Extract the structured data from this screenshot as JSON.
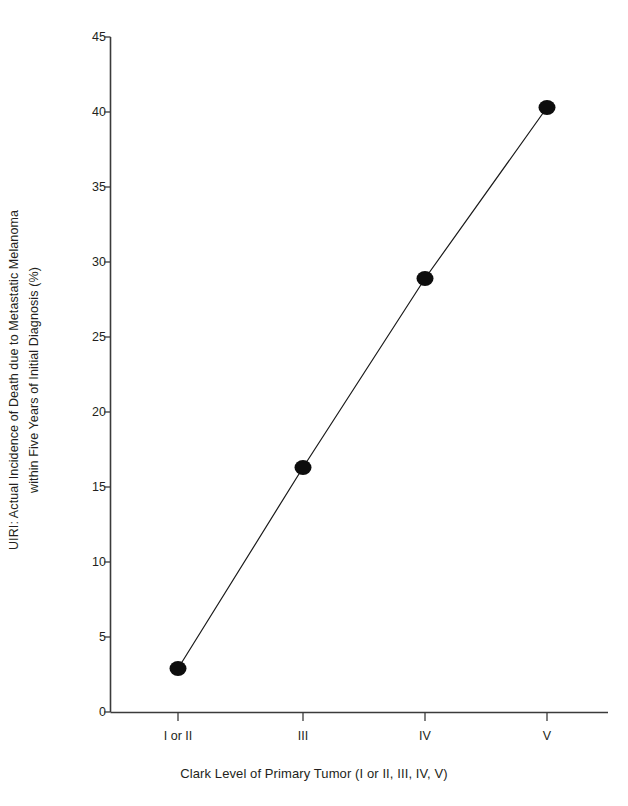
{
  "chart_data": {
    "type": "line",
    "title": "",
    "categories": [
      "I or II",
      "III",
      "IV",
      "V"
    ],
    "values": [
      2.9,
      16.3,
      28.9,
      40.3
    ],
    "series": [
      {
        "name": "UIRI",
        "values": [
          2.9,
          16.3,
          28.9,
          40.3
        ]
      }
    ],
    "xlabel": "Clark Level of Primary Tumor (I or II, III, IV, V)",
    "ylabel_line1": "UIRI: Actual Incidence of Death due to Metastatic Melanoma",
    "ylabel_line2": "within Five Years of Initial Diagnosis (%)",
    "ylim": [
      0,
      45
    ],
    "yticks": [
      0,
      5,
      10,
      15,
      20,
      25,
      30,
      35,
      40,
      45
    ],
    "ytick_labels": [
      "0",
      "5",
      "10",
      "15",
      "20",
      "25",
      "30",
      "35",
      "40",
      "45"
    ],
    "xtick_labels": [
      "I or II",
      "III",
      "IV",
      "V"
    ],
    "grid": false,
    "legend": false,
    "legend_position": "none",
    "marker": "filled-circle",
    "colors": {
      "line": "#1a1a1a",
      "marker": "#0d0d0d",
      "axis": "#3b3b3b",
      "text": "#231f20",
      "background": "#ffffff"
    }
  },
  "axes": {
    "y_axis_name": "y-axis",
    "x_axis_name": "x-axis"
  }
}
